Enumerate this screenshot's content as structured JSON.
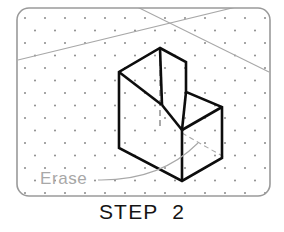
{
  "figure": {
    "caption": "STEP  2",
    "annotation_label": "Erase",
    "border_color": "#9a9a9a",
    "object_line_color": "#0d0d0d",
    "construction_line_color": "#a8a8a8",
    "hidden_line_color": "#8e8e8e",
    "grid_dot_color": "#8a8a8a",
    "background_color": "#ffffff"
  },
  "drawing": {
    "title": "isometric-step-block",
    "sheet": {
      "x": 17,
      "y": 8,
      "width": 253,
      "height": 188,
      "corner_radius": 12
    },
    "grid": {
      "type": "isometric-dot-grid",
      "col_spacing": 20,
      "row_spacing": 12.5,
      "row_offset": 10,
      "dot_radius": 1.0
    },
    "construction_lines": [
      {
        "name": "construction-line-left-up",
        "x1": 18,
        "y1": 60,
        "x2": 269,
        "y2": -1
      },
      {
        "name": "construction-line-right-down",
        "x1": 119,
        "y1": -2,
        "x2": 269,
        "y2": 72
      }
    ],
    "object_outline": {
      "name": "step-block-visible-edges",
      "stroke_width": 2.6,
      "points": [
        {
          "id": "top-apex",
          "x": 160,
          "y": 48
        },
        {
          "id": "top-right",
          "x": 186,
          "y": 62
        },
        {
          "id": "step-inner-right",
          "x": 186,
          "y": 92
        },
        {
          "id": "mid-right-top",
          "x": 222,
          "y": 107
        },
        {
          "id": "bottom-right",
          "x": 222,
          "y": 158
        },
        {
          "id": "bottom-front",
          "x": 182,
          "y": 181
        },
        {
          "id": "bottom-left",
          "x": 119,
          "y": 148
        },
        {
          "id": "top-left",
          "x": 119,
          "y": 72
        },
        {
          "id": "step-inner-left",
          "x": 162,
          "y": 105
        },
        {
          "id": "step-inner-front",
          "x": 182,
          "y": 130
        }
      ]
    },
    "hidden_lines": [
      {
        "name": "hidden-line-vertical-back-edge",
        "x1": 160,
        "y1": 50,
        "x2": 160,
        "y2": 130
      }
    ],
    "erased_lines": [
      {
        "name": "erased-hidden-line-diagonal",
        "x1": 182,
        "y1": 133,
        "x2": 224,
        "y2": 157
      }
    ],
    "annotation": {
      "name": "erase-callout",
      "text_x": 40,
      "text_y": 184,
      "leader": {
        "start_x": 98,
        "start_y": 180,
        "ctrl_x": 160,
        "ctrl_y": 181,
        "end_x": 198,
        "end_y": 143
      }
    }
  }
}
